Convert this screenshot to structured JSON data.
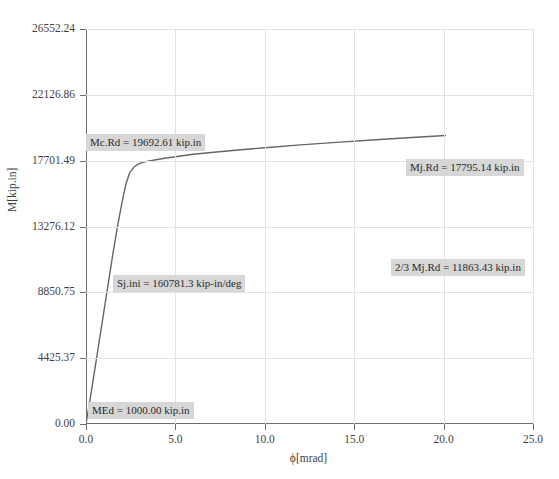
{
  "chart_data": {
    "type": "line",
    "title": "",
    "xlabel": "ϕ[mrad]",
    "ylabel": "M[kip.in]",
    "xlim": [
      0,
      25
    ],
    "ylim": [
      0,
      26552.24
    ],
    "grid": true,
    "legend": "none",
    "x_ticks": [
      "0.0",
      "5.0",
      "10.0",
      "15.0",
      "20.0",
      "25.0"
    ],
    "x_tick_values": [
      0,
      5,
      10,
      15,
      20,
      25
    ],
    "y_ticks": [
      "0.00",
      "4425.37",
      "8850.75",
      "13276.12",
      "17701.49",
      "22126.86",
      "26552.24"
    ],
    "y_tick_values": [
      0,
      4425.37,
      8850.75,
      13276.12,
      17701.49,
      22126.86,
      26552.24
    ],
    "series": [
      {
        "name": "Moment-rotation curve",
        "color": "#666666",
        "x": [
          0.0,
          0.3,
          0.6,
          0.9,
          1.2,
          1.5,
          1.75,
          1.95,
          2.1,
          2.25,
          2.45,
          2.7,
          3.0,
          3.4,
          3.9,
          4.5,
          5.2,
          6.0,
          7.0,
          8.5,
          10.0,
          12.0,
          14.0,
          16.0,
          18.0,
          20.1
        ],
        "y": [
          0,
          2200,
          4500,
          6800,
          9100,
          11400,
          13200,
          14500,
          15400,
          16200,
          16900,
          17300,
          17520,
          17650,
          17760,
          17880,
          18000,
          18130,
          18250,
          18420,
          18570,
          18760,
          18930,
          19090,
          19240,
          19390
        ]
      }
    ],
    "annotations": [
      {
        "id": "mcrd",
        "text": "Mc.Rd = 19692.61 kip.in",
        "x_px": 86,
        "y_px": 134
      },
      {
        "id": "mjrd",
        "text": "Mj.Rd = 17795.14 kip.in",
        "x_px": 406,
        "y_px": 159
      },
      {
        "id": "mjrd23",
        "text": "2/3 Mj.Rd = 11863.43 kip.in",
        "x_px": 391,
        "y_px": 259
      },
      {
        "id": "sjini",
        "text": "Sj.ini = 160781.3 kip-in/deg",
        "x_px": 113,
        "y_px": 275
      },
      {
        "id": "med",
        "text": "MEd = 1000.00 kip.in",
        "x_px": 88,
        "y_px": 402
      }
    ]
  },
  "caption": {
    "text": ""
  }
}
